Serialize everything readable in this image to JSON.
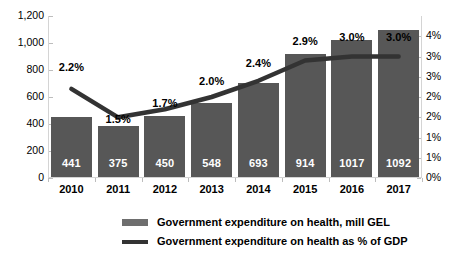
{
  "chart_data": {
    "type": "bar",
    "title": "",
    "subtitle": "",
    "xlabel": "",
    "ylabel": "",
    "categories": [
      "2010",
      "2011",
      "2012",
      "2013",
      "2014",
      "2015",
      "2016",
      "2017"
    ],
    "grid": false,
    "legend_position": "bottom",
    "series": [
      {
        "name": "Government expenditure on health, mill GEL",
        "type": "bar",
        "axis": "left",
        "color": "#575757",
        "values": [
          441,
          375,
          450,
          548,
          693,
          914,
          1017,
          1092
        ],
        "labels": [
          "441",
          "375",
          "450",
          "548",
          "693",
          "914",
          "1017",
          "1092"
        ]
      },
      {
        "name": "Government expenditure on health as % of GDP",
        "type": "line",
        "axis": "right",
        "color": "#333333",
        "values": [
          2.2,
          1.5,
          1.7,
          2.0,
          2.4,
          2.9,
          3.0,
          3.0
        ],
        "labels": [
          "2.2%",
          "1.5%",
          "1.7%",
          "2.0%",
          "2.4%",
          "2.9%",
          "3.0%",
          "3.0%"
        ]
      }
    ],
    "left_axis": {
      "ylim": [
        0,
        1200
      ],
      "tick_values": [
        0,
        200,
        400,
        600,
        800,
        1000,
        1200
      ],
      "tick_labels": [
        "0",
        "200",
        "400",
        "600",
        "800",
        "1,000",
        "1,200"
      ]
    },
    "right_axis": {
      "ylim": [
        0,
        4
      ],
      "tick_values": [
        0,
        0.5,
        1.0,
        1.5,
        2.0,
        2.5,
        3.0,
        3.5,
        4.0
      ],
      "tick_labels": [
        "0%",
        "1%",
        "1%",
        "2%",
        "2%",
        "3%",
        "3%",
        "4%"
      ]
    },
    "colors": {
      "bar": "#575757",
      "line": "#333333",
      "axis": "#d4d4d4",
      "bar_value_text": "#ffffff",
      "background": "#ffffff"
    }
  },
  "legend": {
    "items": [
      {
        "label": "Government expenditure on health, mill GEL",
        "marker": "bar-swatch"
      },
      {
        "label": "Government expenditure on health as % of GDP",
        "marker": "line-swatch"
      }
    ]
  }
}
